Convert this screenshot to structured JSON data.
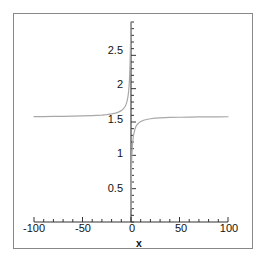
{
  "chart_data": {
    "type": "line",
    "title": "",
    "subtitle": "",
    "xlabel": "x",
    "ylabel": "",
    "xlim": [
      -100,
      100
    ],
    "ylim": [
      0,
      3
    ],
    "grid": false,
    "legend": null,
    "x_ticks": [
      -100,
      -50,
      0,
      50,
      100
    ],
    "x_tick_labels": [
      "-100",
      "-50",
      "0",
      "50",
      "100"
    ],
    "x_minor_tick_step": 10,
    "y_ticks": [
      0.5,
      1,
      1.5,
      2,
      2.5
    ],
    "y_tick_labels": [
      "0.5",
      "1",
      "1.5",
      "2",
      "2.5"
    ],
    "y_minor_tick_step": 0.1,
    "curve_color": "#a8a8a8",
    "axis_color": "#333333",
    "frame_color": "#888888",
    "asymptote_y": 1.57,
    "discontinuity_x": 0,
    "series": [
      {
        "name": "left-branch",
        "x": [
          -100,
          -90,
          -80,
          -70,
          -60,
          -50,
          -40,
          -30,
          -25,
          -20,
          -16,
          -13,
          -10,
          -8,
          -6,
          -5,
          -4,
          -3,
          -2.5,
          -2,
          -1.5,
          -1,
          -0.7,
          -0.5,
          -0.35,
          -0.25,
          -0.18,
          -0.12,
          -0.08,
          -0.05
        ],
        "y": [
          1.581,
          1.582,
          1.583,
          1.585,
          1.587,
          1.591,
          1.596,
          1.604,
          1.611,
          1.621,
          1.633,
          1.648,
          1.671,
          1.695,
          1.735,
          1.768,
          1.816,
          1.893,
          1.951,
          2.034,
          2.159,
          2.36,
          2.53,
          2.68,
          2.8,
          2.89,
          2.94,
          2.97,
          2.99,
          3.0
        ]
      },
      {
        "name": "right-branch",
        "x": [
          0.05,
          0.1,
          0.2,
          0.35,
          0.5,
          0.75,
          1,
          1.5,
          2,
          2.5,
          3,
          4,
          5,
          6,
          8,
          10,
          13,
          16,
          20,
          25,
          30,
          40,
          50,
          60,
          70,
          80,
          90,
          100
        ],
        "y": [
          0.2,
          0.36,
          0.56,
          0.71,
          0.83,
          0.95,
          1.03,
          1.15,
          1.23,
          1.29,
          1.33,
          1.39,
          1.43,
          1.455,
          1.487,
          1.507,
          1.526,
          1.538,
          1.549,
          1.557,
          1.562,
          1.568,
          1.571,
          1.574,
          1.576,
          1.577,
          1.578,
          1.579
        ]
      }
    ]
  },
  "axis": {
    "x_name": "x"
  },
  "ticks": {
    "y": [
      {
        "label": "2.5"
      },
      {
        "label": "2"
      },
      {
        "label": "1.5"
      },
      {
        "label": "1"
      },
      {
        "label": "0.5"
      }
    ],
    "x": [
      {
        "label": "-100"
      },
      {
        "label": "-50"
      },
      {
        "label": "0"
      },
      {
        "label": "50"
      },
      {
        "label": "100"
      }
    ]
  }
}
